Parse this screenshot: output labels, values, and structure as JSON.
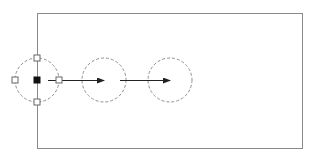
{
  "canvas": {
    "width": 313,
    "height": 158,
    "background": "#ffffff"
  },
  "colors": {
    "line": "#8a8a8a",
    "dashed": "#8f8f8f",
    "arrow": "#222222",
    "grip_fill": "#111111",
    "grip_outline": "#666666"
  },
  "rectangle": {
    "x": 37,
    "y": 13,
    "width": 265,
    "height": 135
  },
  "circles": [
    {
      "cx": 37,
      "cy": 80,
      "r": 22,
      "style": "dashed",
      "selected": true
    },
    {
      "cx": 104,
      "cy": 80,
      "r": 22,
      "style": "dashed",
      "selected": false
    },
    {
      "cx": 170,
      "cy": 80,
      "r": 22,
      "style": "dashed",
      "selected": false
    }
  ],
  "grips": [
    {
      "name": "grip-center",
      "x": 37,
      "y": 80,
      "filled": true
    },
    {
      "name": "grip-top",
      "x": 37,
      "y": 58,
      "filled": false
    },
    {
      "name": "grip-bottom",
      "x": 37,
      "y": 102,
      "filled": false
    },
    {
      "name": "grip-left",
      "x": 15,
      "y": 80,
      "filled": false
    },
    {
      "name": "grip-right",
      "x": 59,
      "y": 80,
      "filled": false
    }
  ],
  "arrows": [
    {
      "x1": 48,
      "y1": 80,
      "x2": 104,
      "y2": 80
    },
    {
      "x1": 120,
      "y1": 80,
      "x2": 170,
      "y2": 80
    }
  ]
}
